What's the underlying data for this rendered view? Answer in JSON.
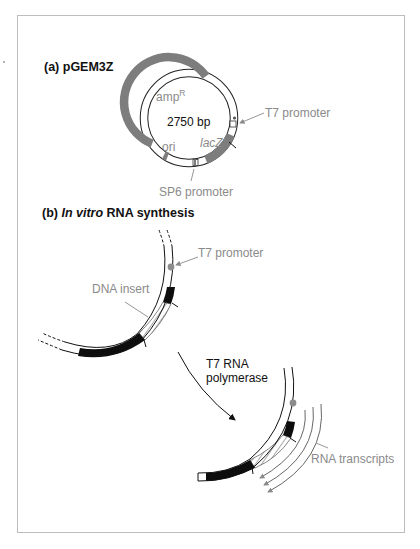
{
  "figure": {
    "panel_a": {
      "heading": "(a)  pGEM3Z",
      "plasmid_size": "2750 bp",
      "labels": {
        "amp": "amp",
        "amp_superscript": "R",
        "ori": "ori",
        "lacz": "lacZ'",
        "t7_promoter": "T7 promoter",
        "sp6_promoter": "SP6 promoter"
      }
    },
    "panel_b": {
      "heading_prefix": "(b)  ",
      "heading_italic": "In vitro",
      "heading_suffix": " RNA synthesis",
      "labels": {
        "t7_promoter": "T7 promoter",
        "dna_insert": "DNA insert",
        "polymerase_line1": "T7 RNA",
        "polymerase_line2": "polymerase",
        "rna_transcripts": "RNA transcripts"
      }
    },
    "colors": {
      "ring_gray": "#7d7d7d",
      "label_gray": "#8a8a8a",
      "black_segment": "#0d0d0d",
      "promoter_dot": "#8c8c8c"
    }
  }
}
